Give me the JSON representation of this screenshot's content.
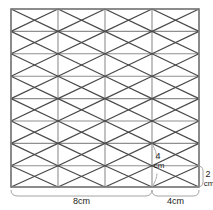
{
  "figure": {
    "type": "geometric-diagram",
    "colors": {
      "background": "#ffffff",
      "grid_line": "#8a8a8a",
      "diagonal_line": "#4a4a4a",
      "border": "#7a7a7a",
      "dimension_line": "#9a9a9a",
      "text": "#1a1a1a"
    }
  },
  "grid": {
    "left": 11,
    "right": 199,
    "top": 9,
    "bottom": 187,
    "vertical_x": [
      11,
      58,
      105,
      152,
      199
    ],
    "horizontal_y": [
      9,
      31.4,
      53.8,
      76.2,
      98.6,
      121,
      143.4,
      165.8,
      187
    ],
    "columns": 4,
    "rows": 8
  },
  "dimensions": {
    "width_main": {
      "value": "8cm",
      "from_x": 11,
      "to_x": 152,
      "y": 196
    },
    "width_secondary": {
      "value": "4cm",
      "from_x": 152,
      "to_x": 199,
      "y": 196
    },
    "height_inner": {
      "value_number": "4",
      "value_unit": "cm",
      "x": 157,
      "top_y": 143.4,
      "bottom_y": 187
    },
    "height_right": {
      "value_number": "2",
      "value_unit": "cm",
      "x": 203,
      "top_y": 165.8,
      "bottom_y": 187
    }
  },
  "labels": {
    "bottom_span_main": "8cm",
    "bottom_span_secondary": "4cm",
    "inner_height_number": "4",
    "inner_height_unit": "cm",
    "right_height_number": "2",
    "right_height_unit": "cm"
  }
}
